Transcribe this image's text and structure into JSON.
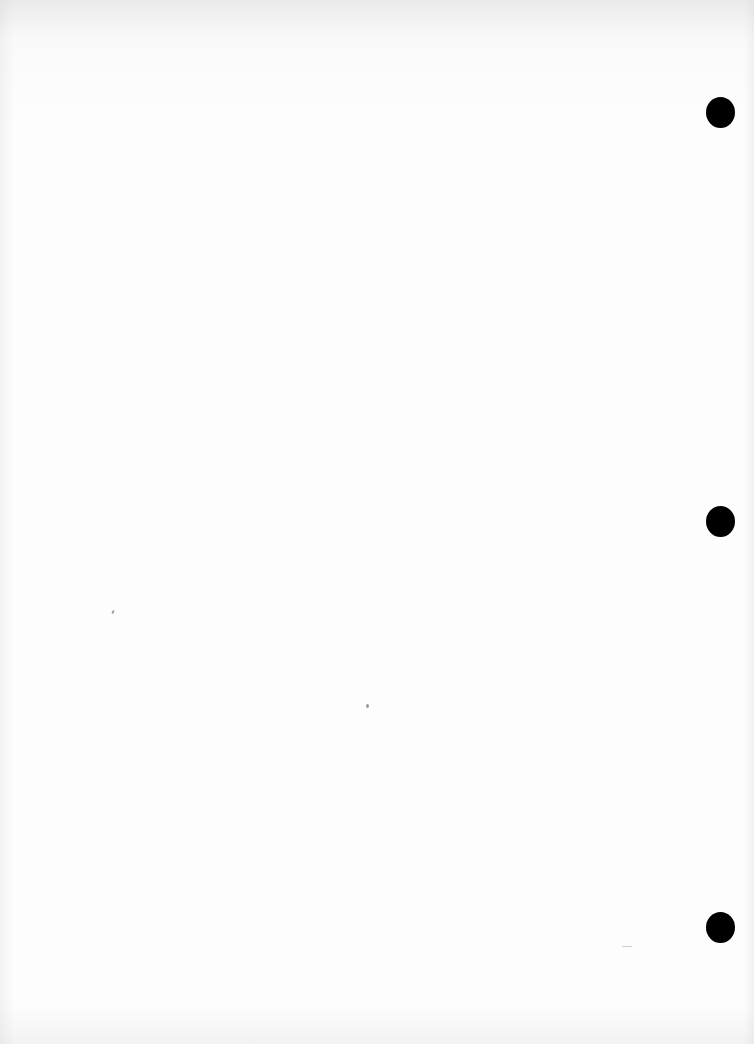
{
  "document": {
    "type": "blank scanned page",
    "text": "",
    "background_color": "#fdfdfd",
    "punch_holes": [
      {
        "id": "top",
        "x": 706,
        "y": 97
      },
      {
        "id": "middle",
        "x": 706,
        "y": 506
      },
      {
        "id": "bottom",
        "x": 706,
        "y": 912
      }
    ],
    "hole_color": "#000000"
  }
}
